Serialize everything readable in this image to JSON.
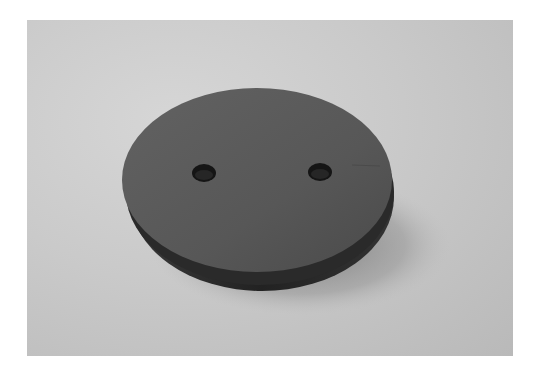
{
  "image": {
    "subject": "dark circular disk with two holes on gray background",
    "colors": {
      "background": "#c8c8c8",
      "disk_top": "#5a5a5a",
      "disk_side": "#2e2e2e",
      "holes": "#141414",
      "shadow": "#7a7a7a"
    }
  }
}
